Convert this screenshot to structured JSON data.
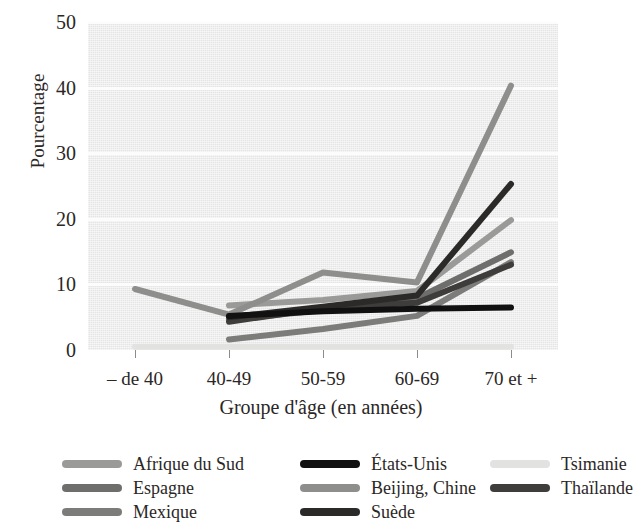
{
  "chart_data": {
    "type": "line",
    "title": "",
    "xlabel": "Groupe d'âge (en années)",
    "ylabel": "Pourcentage",
    "categories": [
      "– de 40",
      "40-49",
      "50-59",
      "60-69",
      "70 et +"
    ],
    "ylim": [
      0,
      50
    ],
    "yticks": [
      0,
      10,
      20,
      30,
      40,
      50
    ],
    "grid": "horizontal-light",
    "legend_position": "bottom",
    "series": [
      {
        "name": "Afrique du Sud",
        "color": "#9a9a99",
        "values": [
          null,
          6.8,
          7.6,
          9.0,
          19.8
        ]
      },
      {
        "name": "Espagne",
        "color": "#6e6e6d",
        "values": [
          null,
          4.6,
          6.1,
          7.9,
          14.9
        ]
      },
      {
        "name": "Mexique",
        "color": "#7c7c7b",
        "values": [
          null,
          1.6,
          3.2,
          5.2,
          13.4
        ]
      },
      {
        "name": "États-Unis",
        "color": "#121111",
        "values": [
          null,
          5.2,
          5.9,
          6.3,
          6.5
        ]
      },
      {
        "name": "Beijing, Chine",
        "color": "#8e8e8d",
        "values": [
          9.3,
          5.4,
          11.8,
          10.3,
          40.3
        ]
      },
      {
        "name": "Suède",
        "color": "#2b2a29",
        "values": [
          null,
          5.0,
          6.6,
          8.3,
          25.3
        ]
      },
      {
        "name": "Tsimanie",
        "color": "#e2e2e1",
        "values": [
          0.5,
          0.5,
          0.5,
          0.5,
          0.5
        ]
      },
      {
        "name": "Thaïlande",
        "color": "#3e3d3c",
        "values": [
          null,
          4.3,
          6.4,
          7.2,
          13.0
        ]
      }
    ]
  },
  "legend": {
    "columns": [
      [
        "Afrique du Sud",
        "Espagne",
        "Mexique"
      ],
      [
        "États-Unis",
        "Beijing, Chine",
        "Suède"
      ],
      [
        "Tsimanie",
        "Thaïlande"
      ]
    ]
  }
}
